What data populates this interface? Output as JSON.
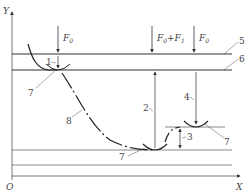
{
  "diagram": {
    "axes": {
      "x_label": "X",
      "y_label": "Y",
      "origin_label": "O"
    },
    "forces": [
      {
        "id": "force-left",
        "label": "F",
        "sub": "0"
      },
      {
        "id": "force-middle",
        "label": "F",
        "sub": "0",
        "plus": "+F",
        "sub2": "1"
      },
      {
        "id": "force-right",
        "label": "F",
        "sub": "0"
      }
    ],
    "callouts": {
      "c1": "1",
      "c2": "2",
      "c3": "3",
      "c4": "4",
      "c5": "5",
      "c6": "6",
      "c7a": "7",
      "c7b": "7",
      "c7c": "7",
      "c8": "8"
    },
    "colors": {
      "line": "#333333",
      "thin": "#555555",
      "text": "#444444"
    }
  }
}
